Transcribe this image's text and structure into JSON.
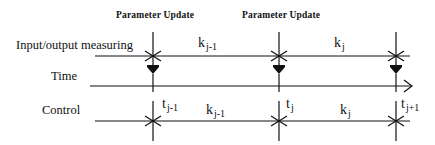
{
  "diagram": {
    "headers": [
      {
        "id": "update1",
        "label": "Parameter Update"
      },
      {
        "id": "update2",
        "label": "Parameter Update"
      }
    ],
    "rows": {
      "io": {
        "label": "Input/output measuring"
      },
      "time": {
        "label": "Time"
      },
      "control": {
        "label": "Control"
      }
    },
    "io_intervals": [
      {
        "base": "k",
        "sub": "j-1"
      },
      {
        "base": "k",
        "sub": "j"
      }
    ],
    "control_intervals": [
      {
        "base": "k",
        "sub": "j-1"
      },
      {
        "base": "k",
        "sub": "j"
      }
    ],
    "time_marks": [
      {
        "base": "t",
        "sub": "j-1"
      },
      {
        "base": "t",
        "sub": "j"
      },
      {
        "base": "t",
        "sub": "j+1"
      }
    ],
    "colors": {
      "ink": "#111111",
      "background": "#ffffff"
    }
  }
}
